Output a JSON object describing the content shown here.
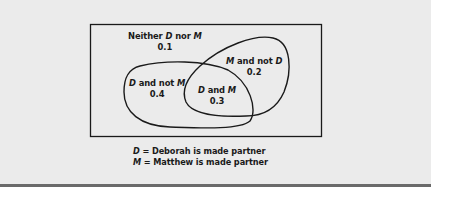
{
  "diagram": {
    "type": "venn",
    "sets": [
      {
        "symbol": "D",
        "meaning": "Deborah is made partner"
      },
      {
        "symbol": "M",
        "meaning": "Matthew is made partner"
      }
    ],
    "regions": {
      "neither": {
        "label_pre": "Neither ",
        "sym1": "D",
        "mid": " nor ",
        "sym2": "M",
        "value": "0.1"
      },
      "d_only": {
        "sym1": "D",
        "mid": " and not ",
        "sym2": "M",
        "value": "0.4"
      },
      "both": {
        "sym1": "D",
        "mid": " and ",
        "sym2": "M",
        "value": "0.3"
      },
      "m_only": {
        "sym1": "M",
        "mid": " and not ",
        "sym2": "D",
        "value": "0.2"
      }
    },
    "legend": [
      {
        "symbol": "D",
        "text": " = Deborah is made partner"
      },
      {
        "symbol": "M",
        "text": " = Matthew is made partner"
      }
    ]
  }
}
